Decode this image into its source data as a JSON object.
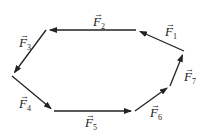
{
  "diagram": {
    "stroke_color": "#222222",
    "vectors": [
      {
        "name": "F",
        "sub": "1",
        "from": [
          184,
          51
        ],
        "to": [
          136,
          30
        ]
      },
      {
        "name": "F",
        "sub": "2",
        "from": [
          136,
          30
        ],
        "to": [
          46,
          30
        ]
      },
      {
        "name": "F",
        "sub": "3",
        "from": [
          46,
          30
        ],
        "to": [
          12,
          76
        ]
      },
      {
        "name": "F",
        "sub": "4",
        "from": [
          12,
          76
        ],
        "to": [
          54,
          111
        ]
      },
      {
        "name": "F",
        "sub": "5",
        "from": [
          54,
          111
        ],
        "to": [
          135,
          111
        ]
      },
      {
        "name": "F",
        "sub": "6",
        "from": [
          135,
          111
        ],
        "to": [
          170,
          86
        ]
      },
      {
        "name": "F",
        "sub": "7",
        "from": [
          170,
          86
        ],
        "to": [
          184,
          51
        ]
      }
    ],
    "labels": {
      "f1": {
        "main": "F",
        "sub": "1"
      },
      "f2": {
        "main": "F",
        "sub": "2"
      },
      "f3": {
        "main": "F",
        "sub": "3"
      },
      "f4": {
        "main": "F",
        "sub": "4"
      },
      "f5": {
        "main": "F",
        "sub": "5"
      },
      "f6": {
        "main": "F",
        "sub": "6"
      },
      "f7": {
        "main": "F",
        "sub": "7"
      }
    },
    "vector_arrow_glyph": "→"
  }
}
